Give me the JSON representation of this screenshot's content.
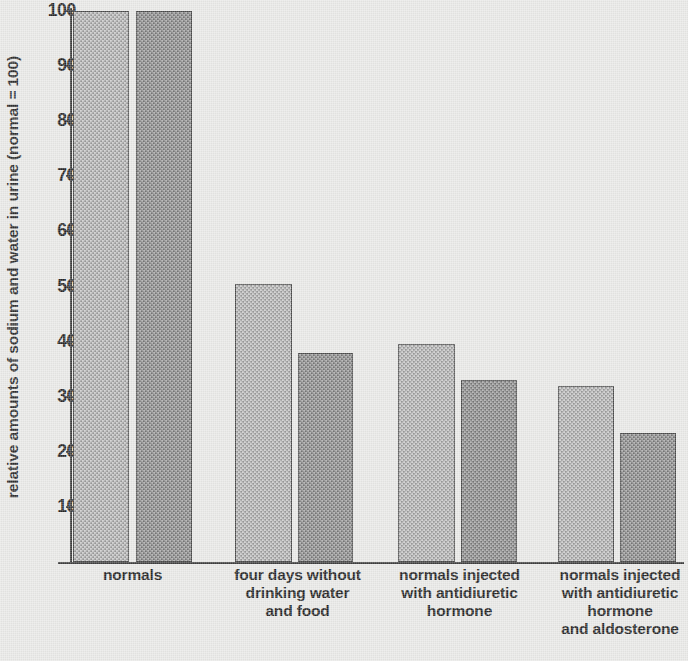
{
  "chart_data": {
    "type": "bar",
    "title": "",
    "xlabel": "",
    "ylabel": "relative amounts of sodium and water in urine (normal = 100)",
    "ylim": [
      0,
      100
    ],
    "yticks": [
      10,
      20,
      30,
      40,
      50,
      60,
      70,
      80,
      90,
      100
    ],
    "grid": false,
    "legend": "none",
    "categories": [
      "normals",
      "four days without drinking water and food",
      "normals injected with antidiuretic hormone",
      "normals injected with antidiuretic hormone and aldosterone"
    ],
    "series": [
      {
        "name": "sodium",
        "shade": "light",
        "values": [
          100,
          50.5,
          39.5,
          32
        ]
      },
      {
        "name": "water",
        "shade": "dark",
        "values": [
          100,
          38,
          33,
          23.5
        ]
      }
    ]
  },
  "axis": {
    "y_title": "relative amounts of sodium and water in urine (normal = 100)",
    "tick_labels": [
      "100",
      "90",
      "80",
      "70",
      "60",
      "50",
      "40",
      "30",
      "20",
      "10"
    ]
  },
  "groups": [
    {
      "id": "normals",
      "lines": [
        "normals"
      ],
      "bars": [
        {
          "shade": "light",
          "value": 100
        },
        {
          "shade": "dark",
          "value": 100
        }
      ]
    },
    {
      "id": "four-days-without-water-and-food",
      "lines": [
        "four days without",
        "drinking water",
        "and food"
      ],
      "bars": [
        {
          "shade": "light",
          "value": 50.5
        },
        {
          "shade": "dark",
          "value": 38
        }
      ]
    },
    {
      "id": "normals-injected-adh",
      "lines": [
        "normals injected",
        "with antidiuretic",
        "hormone"
      ],
      "bars": [
        {
          "shade": "light",
          "value": 39.5
        },
        {
          "shade": "dark",
          "value": 33
        }
      ]
    },
    {
      "id": "normals-injected-adh-aldosterone",
      "lines": [
        "normals injected",
        "with antidiuretic",
        "hormone",
        "and aldosterone"
      ],
      "bars": [
        {
          "shade": "light",
          "value": 32
        },
        {
          "shade": "dark",
          "value": 23.5
        }
      ]
    }
  ],
  "colors": {
    "background": "#e9e9e7",
    "bar_light": "#aeaeae",
    "bar_dark": "#8b8b8b",
    "axis": "#3c3c3c",
    "text": "#242424"
  }
}
